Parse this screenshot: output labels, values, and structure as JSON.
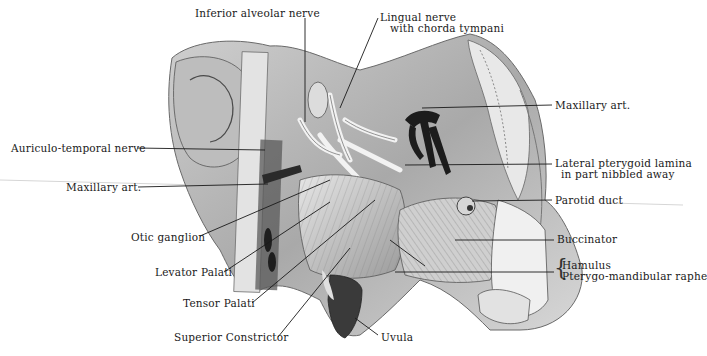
{
  "figure": {
    "labels": [
      {
        "id": "inferior-alveolar-nerve",
        "text": "Inferior alveolar nerve",
        "x": 195,
        "y": 8
      },
      {
        "id": "lingual-nerve",
        "text": "Lingual nerve",
        "text2": "with chorda tympani",
        "x": 380,
        "y": 12
      },
      {
        "id": "auriculo-temporal-nerve",
        "text": "Auriculo-temporal nerve",
        "x": 11,
        "y": 143
      },
      {
        "id": "maxillary-art-left",
        "text": "Maxillary art.",
        "x": 66,
        "y": 182
      },
      {
        "id": "otic-ganglion",
        "text": "Otic ganglion",
        "x": 131,
        "y": 233
      },
      {
        "id": "levator-palati",
        "text": "Levator Palati",
        "x": 155,
        "y": 268
      },
      {
        "id": "tensor-palati",
        "text": "Tensor Palati",
        "x": 183,
        "y": 299
      },
      {
        "id": "superior-constrictor",
        "text": "Superior Constrictor",
        "x": 174,
        "y": 333
      },
      {
        "id": "uvula",
        "text": "Uvula",
        "x": 381,
        "y": 333
      },
      {
        "id": "maxillary-art-right",
        "text": "Maxillary art.",
        "x": 555,
        "y": 101
      },
      {
        "id": "lateral-pterygoid-lamina",
        "text": "Lateral pterygoid lamina",
        "text2": "in part nibbled away",
        "x": 555,
        "y": 159
      },
      {
        "id": "parotid-duct",
        "text": "Parotid duct",
        "x": 555,
        "y": 196
      },
      {
        "id": "buccinator",
        "text": "Buccinator",
        "x": 557,
        "y": 235
      },
      {
        "id": "hamulus",
        "text": "Hamulus",
        "text2": "Pterygo-mandibular raphe",
        "x": 560,
        "y": 262
      }
    ],
    "colors": {
      "ink": "#1a1a1a",
      "tissue_light": "#d9d9d9",
      "tissue_mid": "#a8a8a8",
      "tissue_dark": "#555555",
      "artery": "#1c1c1c"
    }
  }
}
